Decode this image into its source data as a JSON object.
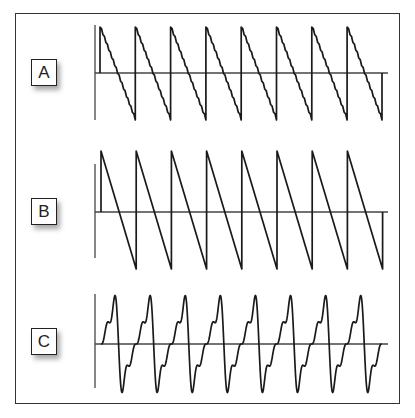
{
  "panels": [
    {
      "label": "A",
      "waveform": "stepped-sawtooth",
      "description": "Sawtooth wave with staircase (stepped) descending ramp",
      "cycles": 8,
      "label_box": {
        "x": 31,
        "y": 59
      },
      "axis": {
        "x": 95,
        "y_top": 25,
        "y_bottom": 120,
        "baseline_y": 73,
        "x_end": 388
      },
      "wave": {
        "x_start": 100,
        "period": 35.3,
        "top": 27,
        "bottom": 120,
        "steps": 12,
        "end_x": 382
      }
    },
    {
      "label": "B",
      "waveform": "sawtooth",
      "description": "Smooth sawtooth wave with linear descending ramp",
      "cycles": 8,
      "label_box": {
        "x": 31,
        "y": 198
      },
      "axis": {
        "x": 95,
        "y_top": 164,
        "y_bottom": 258,
        "baseline_y": 212,
        "x_end": 388
      },
      "wave": {
        "x_start": 101,
        "period": 35.2,
        "top": 151,
        "bottom": 269,
        "end_x": 383
      }
    },
    {
      "label": "C",
      "waveform": "sawtooth-with-harmonics",
      "description": "Sawtooth-like wave approximated from harmonics, rising in steps then sharp drop",
      "cycles": 8,
      "label_box": {
        "x": 31,
        "y": 328
      },
      "axis": {
        "x": 95,
        "y_top": 294,
        "y_bottom": 388,
        "baseline_y": 344,
        "x_end": 388
      },
      "wave": {
        "x_start": 101,
        "period": 35.1,
        "top": 295,
        "bottom": 392,
        "end_x": 382
      }
    }
  ],
  "colors": {
    "stroke": "#1a1a1a",
    "axis": "#444444",
    "frame": "#333333"
  }
}
